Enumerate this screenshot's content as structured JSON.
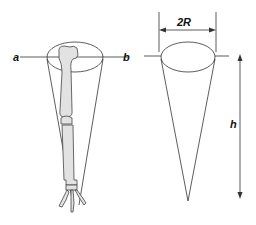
{
  "diagram": {
    "left_figure": {
      "description": "Limb bone (femur, tibia, foot) enclosed in a cone",
      "section_line_labels": {
        "left": "a",
        "right": "b"
      }
    },
    "right_figure": {
      "description": "Idealized cone",
      "diameter_label": "2R",
      "height_label": "h"
    },
    "colors": {
      "line": "#333333",
      "bone_fill": "#e0e0e0"
    }
  }
}
